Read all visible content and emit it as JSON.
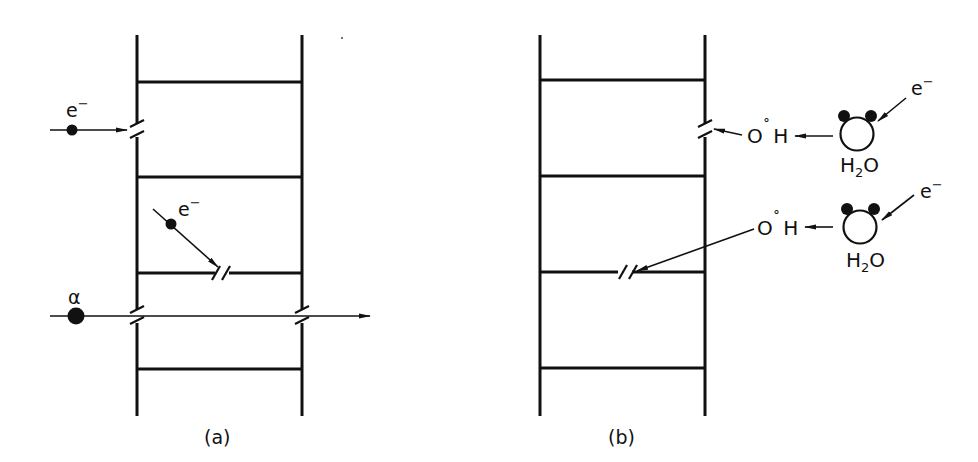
{
  "figure": {
    "panels": [
      {
        "id": "a",
        "label": "(a)",
        "description": "Direct action of radiation on a DNA ladder",
        "particles": [
          {
            "symbol": "e⁻",
            "name": "electron",
            "effect": "single-strand break in backbone (left rail)"
          },
          {
            "symbol": "e⁻",
            "name": "electron",
            "effect": "break in rung (base pair)"
          },
          {
            "symbol": "α",
            "name": "alpha particle",
            "effect": "double-strand break, passes through both rails"
          }
        ]
      },
      {
        "id": "b",
        "label": "(b)",
        "description": "Indirect action via water radiolysis producing hydroxyl radicals",
        "molecules": [
          {
            "incident": "e⁻",
            "molecule": "H₂O",
            "radical": "O˚H",
            "effect": "break in backbone (right rail)"
          },
          {
            "incident": "e⁻",
            "molecule": "H₂O",
            "radical": "O˚H",
            "effect": "break in rung (base pair)"
          }
        ]
      }
    ]
  },
  "labels": {
    "panel_a": "(a)",
    "panel_b": "(b)",
    "electron_a1": "e",
    "electron_a1_sup": "−",
    "electron_a2": "e",
    "electron_a2_sup": "−",
    "alpha": "α",
    "electron_b1": "e",
    "electron_b1_sup": "−",
    "electron_b2": "e",
    "electron_b2_sup": "−",
    "radical_b1_o": "O",
    "radical_b1_dot": "˚",
    "radical_b1_h": "H",
    "radical_b2_o": "O",
    "radical_b2_dot": "˚",
    "radical_b2_h": "H",
    "water_b1_h": "H",
    "water_b1_sub": "2",
    "water_b1_o": "O",
    "water_b2_h": "H",
    "water_b2_sub": "2",
    "water_b2_o": "O"
  },
  "colors": {
    "ink": "#111111",
    "background": "#ffffff"
  }
}
